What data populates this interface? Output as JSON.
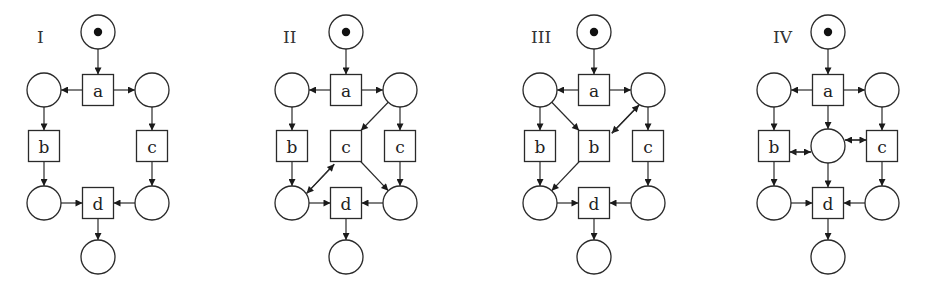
{
  "figure": {
    "background": "#ffffff",
    "stroke_color": "#2a2a2a",
    "place_radius": 17,
    "transition_size": 31
  },
  "nets": [
    {
      "label": "I",
      "label_pos": [
        37,
        37
      ],
      "places": [
        {
          "id": "p0",
          "x": 98,
          "y": 32,
          "tokens": 1
        },
        {
          "id": "pL1",
          "x": 44,
          "y": 90,
          "tokens": 0
        },
        {
          "id": "pR1",
          "x": 152,
          "y": 90,
          "tokens": 0
        },
        {
          "id": "pL2",
          "x": 44,
          "y": 203,
          "tokens": 0
        },
        {
          "id": "pR2",
          "x": 152,
          "y": 203,
          "tokens": 0
        },
        {
          "id": "pEnd",
          "x": 98,
          "y": 257,
          "tokens": 0
        }
      ],
      "transitions": [
        {
          "id": "a",
          "label": "a",
          "x": 98,
          "y": 90
        },
        {
          "id": "b",
          "label": "b",
          "x": 44,
          "y": 146
        },
        {
          "id": "c",
          "label": "c",
          "x": 152,
          "y": 146
        },
        {
          "id": "d",
          "label": "d",
          "x": 98,
          "y": 203
        }
      ],
      "arcs": [
        [
          "p0",
          "a"
        ],
        [
          "a",
          "pL1"
        ],
        [
          "a",
          "pR1"
        ],
        [
          "pL1",
          "b"
        ],
        [
          "pR1",
          "c"
        ],
        [
          "b",
          "pL2"
        ],
        [
          "c",
          "pR2"
        ],
        [
          "pL2",
          "d"
        ],
        [
          "pR2",
          "d"
        ],
        [
          "d",
          "pEnd"
        ]
      ]
    },
    {
      "label": "II",
      "label_pos": [
        283,
        37
      ],
      "places": [
        {
          "id": "p0",
          "x": 346,
          "y": 32,
          "tokens": 1
        },
        {
          "id": "pL1",
          "x": 292,
          "y": 90,
          "tokens": 0
        },
        {
          "id": "pR1",
          "x": 400,
          "y": 90,
          "tokens": 0
        },
        {
          "id": "pL2",
          "x": 292,
          "y": 203,
          "tokens": 0
        },
        {
          "id": "pR2",
          "x": 400,
          "y": 203,
          "tokens": 0
        },
        {
          "id": "pEnd",
          "x": 346,
          "y": 257,
          "tokens": 0
        }
      ],
      "transitions": [
        {
          "id": "a",
          "label": "a",
          "x": 346,
          "y": 90
        },
        {
          "id": "b",
          "label": "b",
          "x": 292,
          "y": 146
        },
        {
          "id": "c2",
          "label": "c",
          "x": 346,
          "y": 146
        },
        {
          "id": "c",
          "label": "c",
          "x": 400,
          "y": 146
        },
        {
          "id": "d",
          "label": "d",
          "x": 346,
          "y": 203
        }
      ],
      "arcs": [
        [
          "p0",
          "a"
        ],
        [
          "a",
          "pL1"
        ],
        [
          "a",
          "pR1"
        ],
        [
          "pL1",
          "b"
        ],
        [
          "pR1",
          "c"
        ],
        [
          "pR1",
          "c2"
        ],
        [
          "b",
          "pL2"
        ],
        [
          "c",
          "pR2"
        ],
        [
          "c2",
          "pL2",
          -4
        ],
        [
          "pL2",
          "c2",
          4
        ],
        [
          "c2",
          "pR2"
        ],
        [
          "pL2",
          "d"
        ],
        [
          "pR2",
          "d"
        ],
        [
          "d",
          "pEnd"
        ]
      ]
    },
    {
      "label": "III",
      "label_pos": [
        531,
        37
      ],
      "places": [
        {
          "id": "p0",
          "x": 594,
          "y": 32,
          "tokens": 1
        },
        {
          "id": "pL1",
          "x": 540,
          "y": 90,
          "tokens": 0
        },
        {
          "id": "pR1",
          "x": 648,
          "y": 90,
          "tokens": 0
        },
        {
          "id": "pL2",
          "x": 540,
          "y": 203,
          "tokens": 0
        },
        {
          "id": "pR2",
          "x": 648,
          "y": 203,
          "tokens": 0
        },
        {
          "id": "pEnd",
          "x": 594,
          "y": 257,
          "tokens": 0
        }
      ],
      "transitions": [
        {
          "id": "a",
          "label": "a",
          "x": 594,
          "y": 90
        },
        {
          "id": "b",
          "label": "b",
          "x": 540,
          "y": 146
        },
        {
          "id": "b2",
          "label": "b",
          "x": 594,
          "y": 146
        },
        {
          "id": "c",
          "label": "c",
          "x": 648,
          "y": 146
        },
        {
          "id": "d",
          "label": "d",
          "x": 594,
          "y": 203
        }
      ],
      "arcs": [
        [
          "p0",
          "a"
        ],
        [
          "a",
          "pL1"
        ],
        [
          "a",
          "pR1"
        ],
        [
          "pL1",
          "b"
        ],
        [
          "pR1",
          "c"
        ],
        [
          "pL1",
          "b2"
        ],
        [
          "pR1",
          "b2",
          -4
        ],
        [
          "b2",
          "pR1",
          4
        ],
        [
          "b",
          "pL2"
        ],
        [
          "c",
          "pR2"
        ],
        [
          "b2",
          "pL2"
        ],
        [
          "pL2",
          "d"
        ],
        [
          "pR2",
          "d"
        ],
        [
          "d",
          "pEnd"
        ]
      ]
    },
    {
      "label": "IV",
      "label_pos": [
        773,
        37
      ],
      "places": [
        {
          "id": "p0",
          "x": 828,
          "y": 32,
          "tokens": 1
        },
        {
          "id": "pL1",
          "x": 774,
          "y": 90,
          "tokens": 0
        },
        {
          "id": "pR1",
          "x": 882,
          "y": 90,
          "tokens": 0
        },
        {
          "id": "pM",
          "x": 828,
          "y": 146,
          "tokens": 0
        },
        {
          "id": "pL2",
          "x": 774,
          "y": 203,
          "tokens": 0
        },
        {
          "id": "pR2",
          "x": 882,
          "y": 203,
          "tokens": 0
        },
        {
          "id": "pEnd",
          "x": 828,
          "y": 257,
          "tokens": 0
        }
      ],
      "transitions": [
        {
          "id": "a",
          "label": "a",
          "x": 828,
          "y": 90
        },
        {
          "id": "b",
          "label": "b",
          "x": 774,
          "y": 146
        },
        {
          "id": "c",
          "label": "c",
          "x": 882,
          "y": 146
        },
        {
          "id": "d",
          "label": "d",
          "x": 828,
          "y": 203
        }
      ],
      "arcs": [
        [
          "p0",
          "a"
        ],
        [
          "a",
          "pL1"
        ],
        [
          "a",
          "pR1"
        ],
        [
          "a",
          "pM"
        ],
        [
          "pL1",
          "b"
        ],
        [
          "pR1",
          "c"
        ],
        [
          "pM",
          "b",
          -6
        ],
        [
          "b",
          "pM",
          6
        ],
        [
          "pM",
          "c",
          -6
        ],
        [
          "c",
          "pM",
          6
        ],
        [
          "b",
          "pL2"
        ],
        [
          "c",
          "pR2"
        ],
        [
          "pM",
          "d"
        ],
        [
          "pL2",
          "d"
        ],
        [
          "pR2",
          "d"
        ],
        [
          "d",
          "pEnd"
        ]
      ]
    }
  ]
}
